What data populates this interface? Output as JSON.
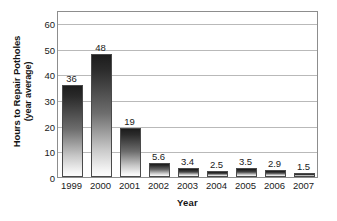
{
  "chart_data": {
    "type": "bar",
    "title": "",
    "subtitle": "",
    "xlabel": "Year",
    "ylabel": "Hours to Repair Potholes (year average)",
    "ylabel_line1": "Hours to Repair Potholes",
    "ylabel_line2": "(year average)",
    "categories": [
      "1999",
      "2000",
      "2001",
      "2002",
      "2003",
      "2004",
      "2005",
      "2006",
      "2007"
    ],
    "values": [
      36,
      48,
      19,
      5.6,
      3.4,
      2.5,
      3.5,
      2.9,
      1.5
    ],
    "data_labels": [
      "36",
      "48",
      "19",
      "5.6",
      "3.4",
      "2.5",
      "3.5",
      "2.9",
      "1.5"
    ],
    "ylim": [
      0,
      65
    ],
    "yticks": [
      0,
      10,
      20,
      30,
      40,
      50,
      60
    ],
    "ytick_labels": [
      "0",
      "10",
      "20",
      "30",
      "40",
      "50",
      "60"
    ],
    "grid": true,
    "grid_axis": "y",
    "legend": false,
    "legend_position": "none",
    "bar_style": "vertical-gradient-dark-to-light",
    "colors": {
      "bar_top": "#1c1c1c",
      "bar_bottom": "#fdfdfd",
      "bar_outline": "#4a4a4a",
      "gridline": "#b9b9b9",
      "frame": "#8d8d8d",
      "text": "#1a1a1a",
      "background": "#ffffff"
    }
  }
}
